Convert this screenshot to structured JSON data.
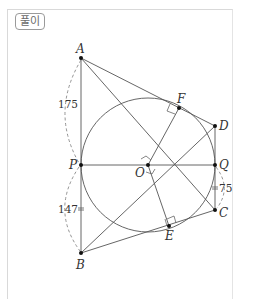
{
  "badge": {
    "label": "풀이"
  },
  "diagram": {
    "points": {
      "A": {
        "label": "A",
        "x": 81,
        "y": 58
      },
      "B": {
        "label": "B",
        "x": 81,
        "y": 253
      },
      "P": {
        "label": "P",
        "x": 81,
        "y": 165
      },
      "O": {
        "label": "O",
        "x": 148,
        "y": 165
      },
      "Q": {
        "label": "Q",
        "x": 215,
        "y": 165
      },
      "D": {
        "label": "D",
        "x": 215,
        "y": 126
      },
      "C": {
        "label": "C",
        "x": 215,
        "y": 210
      },
      "F": {
        "label": "F",
        "x": 179,
        "y": 108
      },
      "E": {
        "label": "E",
        "x": 169,
        "y": 226
      }
    },
    "circle": {
      "center": "O",
      "radius": 67
    },
    "measurements": {
      "AP": "175",
      "BP": "147",
      "QC": "75"
    }
  }
}
